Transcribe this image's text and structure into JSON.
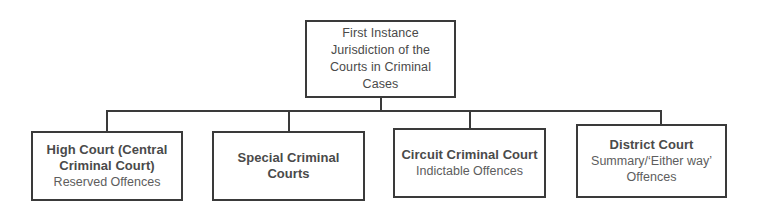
{
  "diagram": {
    "type": "hierarchy-tree",
    "line_color": "#3a3a3a",
    "text_color": "#4a4a4a",
    "background": "#ffffff",
    "root": {
      "title": "First Instance Jurisdiction of the Courts in Criminal Cases"
    },
    "children": [
      {
        "title": "High Court (Central Criminal Court)",
        "subtitle": "Reserved Offences"
      },
      {
        "title": "Special Criminal Courts",
        "subtitle": ""
      },
      {
        "title": "Circuit Criminal Court",
        "subtitle": "Indictable Offences"
      },
      {
        "title": "District Court",
        "subtitle": "Summary/‘Either way’ Offences"
      }
    ]
  }
}
